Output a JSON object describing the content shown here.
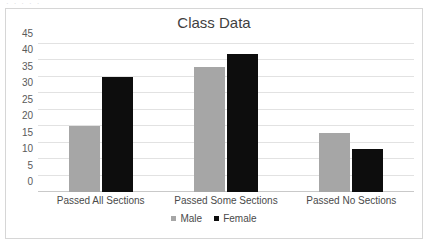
{
  "top_cutoff_text": "· · · · ·",
  "chart_data": {
    "type": "bar",
    "title": "Class Data",
    "xlabel": "",
    "ylabel": "",
    "ylim": [
      0,
      45
    ],
    "ytick_step": 5,
    "yticks": [
      45,
      40,
      35,
      30,
      25,
      20,
      15,
      10,
      5,
      0
    ],
    "grid": true,
    "legend_position": "bottom",
    "categories": [
      "Passed All Sections",
      "Passed Some Sections",
      "Passed No Sections"
    ],
    "series": [
      {
        "name": "Male",
        "color": "#a6a6a6",
        "values": [
          20,
          38,
          18
        ]
      },
      {
        "name": "Female",
        "color": "#0d0d0d",
        "values": [
          35,
          42,
          13
        ]
      }
    ]
  },
  "colors": {
    "male_bar": "#a6a6a6",
    "female_bar": "#0d0d0d",
    "gridline": "#e2e2e2",
    "axis": "#c9c9c9",
    "card_border": "#d6d6d6",
    "title_text": "#3f3f3f",
    "label_text": "#4a4a4a"
  }
}
